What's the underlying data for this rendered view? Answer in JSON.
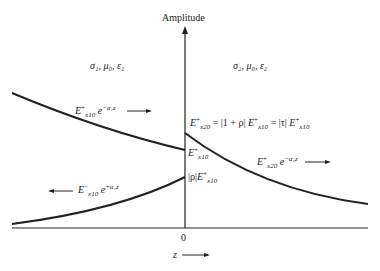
{
  "axis": {
    "y_label": "Amplitude",
    "origin_label": "0",
    "x_label": "z"
  },
  "regions": {
    "left": "σ₁, μ₀, ε₁",
    "right": "σ₂, μ₀, ε₂"
  },
  "waves": {
    "incident": {
      "E": "E",
      "sup": "+",
      "sub": "x10",
      "exp": "e",
      "exp_sup": "−α₁z",
      "direction": "right"
    },
    "reflected": {
      "E": "E",
      "sup": "−",
      "sub": "x10",
      "exp": "e",
      "exp_sup": "+α₁z",
      "direction": "left"
    },
    "transmitted": {
      "E": "E",
      "sup": "+",
      "sub": "x20",
      "exp": "e",
      "exp_sup": "−α₂z",
      "direction": "right"
    }
  },
  "interface_labels": {
    "transmitted_amplitude": "= |1 + ρ|",
    "transmitted_eq2": "= |τ|",
    "incident_amplitude_sub": "x10",
    "reflected_prefix": "|ρ|"
  },
  "colors": {
    "line": "#222222",
    "background": "#ffffff"
  }
}
